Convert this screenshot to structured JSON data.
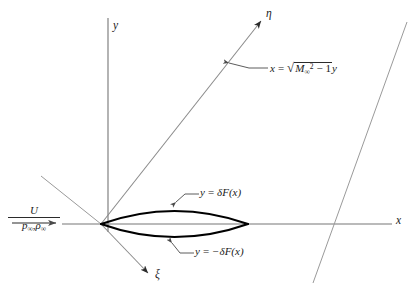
{
  "figure": {
    "type": "diagram",
    "background_color": "#ffffff",
    "line_color": "#6f6f6f",
    "body_color": "#000000",
    "text_color": "#1a1a1a"
  },
  "axes": {
    "x_label": "x",
    "y_label": "y",
    "eta_label": "η",
    "xi_label": "ξ"
  },
  "freestream": {
    "numerator": "U",
    "denominator_pressure": "p",
    "denominator_pressure_sub": "∞",
    "denominator_separator": ",",
    "denominator_density": "ρ",
    "denominator_density_sub": "∞",
    "arrow": "→"
  },
  "annotations": {
    "mach_line": {
      "lhs": "x",
      "equals": "=",
      "radical": "√",
      "radicand_base": "M",
      "radicand_sub": "∞",
      "radicand_sup": "2",
      "radicand_rest": "− 1",
      "trailing": "y",
      "full_text": "x = √(M∞² − 1) y"
    },
    "upper_surface": {
      "lhs": "y",
      "equals": "=",
      "rhs": "δF(x)",
      "full_text": "y = δF(x)"
    },
    "lower_surface": {
      "lhs": "y",
      "equals": "=",
      "rhs": "−δF(x)",
      "full_text": "y = −δF(x)"
    }
  },
  "geometry": {
    "origin": [
      101,
      224
    ],
    "x_axis_end": [
      392,
      224
    ],
    "y_axis_top": [
      108,
      18
    ],
    "eta_arrow_tip": [
      264,
      18
    ],
    "xi_arrow_tip": [
      152,
      276
    ],
    "chord_start": [
      101,
      224
    ],
    "chord_end": [
      248,
      224
    ],
    "thickness_px": 18,
    "mach_angle_deg": 45
  }
}
